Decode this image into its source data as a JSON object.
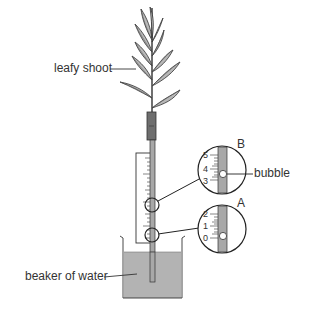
{
  "diagram": {
    "labels": {
      "leafy_shoot": "leafy shoot",
      "bubble": "bubble",
      "beaker": "beaker of water"
    },
    "magnified_views": [
      {
        "id": "B",
        "letter": "B",
        "scale": [
          "5",
          "4",
          "3"
        ],
        "bubble_at": 3.5
      },
      {
        "id": "A",
        "letter": "A",
        "scale": [
          "2",
          "1",
          "0"
        ],
        "bubble_at": 0.3
      }
    ],
    "colors": {
      "leaf_fill": "#b5b5b5",
      "stroke": "#333333",
      "water": "#b3b3b3",
      "tube_fill": "#a8a8a8",
      "sleeve": "#6e6e6e"
    }
  }
}
